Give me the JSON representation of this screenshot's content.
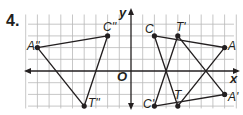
{
  "problem": {
    "number": "4."
  },
  "axes": {
    "x_label": "x",
    "y_label": "y",
    "origin_label": "O"
  },
  "grid": {
    "origin_px": [
      131,
      71
    ],
    "unit_px": 11.7,
    "x_range": [
      -9,
      9
    ],
    "y_range": [
      -3,
      5
    ]
  },
  "colors": {
    "grid": "#b9b9b9",
    "axis": "#231f20",
    "figure": "#231f20"
  },
  "triangles": [
    {
      "name": "A''C''T''",
      "vertices": [
        {
          "label": "A''",
          "x": -8,
          "y": 2
        },
        {
          "label": "C''",
          "x": -2,
          "y": 3
        },
        {
          "label": "T''",
          "x": -4,
          "y": -3
        }
      ]
    },
    {
      "name": "CAT",
      "vertices": [
        {
          "label": "C",
          "x": 2,
          "y": 3
        },
        {
          "label": "A",
          "x": 8,
          "y": 2
        },
        {
          "label": "T",
          "x": 4,
          "y": -3
        }
      ]
    },
    {
      "name": "C'A'T'",
      "vertices": [
        {
          "label": "C'",
          "x": 2,
          "y": -3
        },
        {
          "label": "A'",
          "x": 8,
          "y": -2
        },
        {
          "label": "T'",
          "x": 4,
          "y": 3
        }
      ]
    }
  ],
  "labels": {
    "A2": "A''",
    "C2": "C''",
    "T2": "T''",
    "C": "C",
    "T1": "T'",
    "A": "A",
    "C1": "C'",
    "T": "T",
    "A1": "A'"
  }
}
